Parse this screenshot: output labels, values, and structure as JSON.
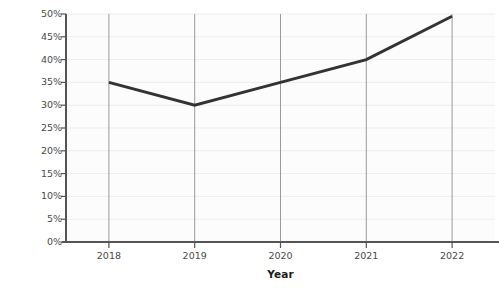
{
  "chart_data": {
    "type": "line",
    "title": "",
    "xlabel": "Year",
    "ylabel": "Gross profit percentage",
    "categories": [
      "2018",
      "2019",
      "2020",
      "2021",
      "2022"
    ],
    "x": [
      2018,
      2019,
      2020,
      2021,
      2022
    ],
    "values": [
      35,
      30,
      35,
      40,
      49.5
    ],
    "value_labels": [
      "35%",
      "30%",
      "35%",
      "40%",
      "49.5%"
    ],
    "series": [
      {
        "name": "Gross profit percentage",
        "values": [
          35,
          30,
          35,
          40,
          49.5
        ]
      }
    ],
    "ylim": [
      0,
      50
    ],
    "xlim": [
      2017.5,
      2022.5
    ],
    "y_ticks": [
      0,
      5,
      10,
      15,
      20,
      25,
      30,
      35,
      40,
      45,
      50
    ],
    "y_tick_labels": [
      "0%",
      "5%",
      "10%",
      "15%",
      "20%",
      "25%",
      "30%",
      "35%",
      "40%",
      "45%",
      "50%"
    ],
    "x_tick_labels": [
      "2018",
      "2019",
      "2020",
      "2021",
      "2022"
    ],
    "grid": {
      "horizontal": true,
      "vertical": true,
      "horizontal_color": "#ededed",
      "vertical_color": "#9a9a9a"
    },
    "legend": null,
    "legend_position": "none",
    "line_color": "#333333",
    "line_width": 3,
    "axis_color": "#555555",
    "background_color": "#fcfcfc"
  }
}
